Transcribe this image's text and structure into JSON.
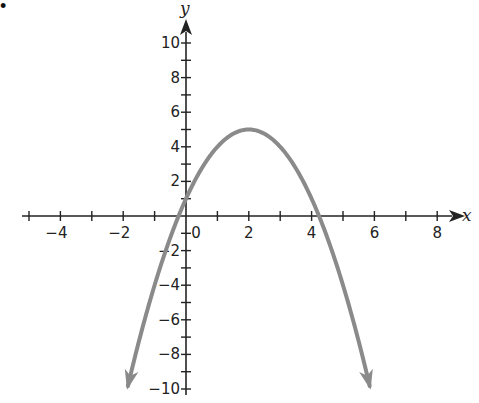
{
  "bullet": "•",
  "chart_data": {
    "type": "line",
    "title": "",
    "xlabel": "x",
    "ylabel": "y",
    "function": "y = -(x - 2)^2 + 5",
    "vertex": [
      2,
      5
    ],
    "y_intercept": 1,
    "x_intercepts": [
      -0.24,
      4.24
    ],
    "xlim": [
      -5.2,
      8.6
    ],
    "ylim": [
      -10.4,
      11.3
    ],
    "x_ticks": [
      -5,
      -4,
      -3,
      -2,
      -1,
      0,
      1,
      2,
      3,
      4,
      5,
      6,
      7,
      8
    ],
    "x_tick_labels": [
      "-4",
      "-2",
      "0",
      "2",
      "4",
      "6",
      "8"
    ],
    "x_tick_label_values": [
      -4,
      -2,
      0,
      2,
      4,
      6,
      8
    ],
    "y_ticks": [
      -10,
      -9,
      -8,
      -7,
      -6,
      -5,
      -4,
      -3,
      -2,
      -1,
      1,
      2,
      3,
      4,
      5,
      6,
      7,
      8,
      9,
      10
    ],
    "y_tick_labels": [
      "10",
      "8",
      "6",
      "4",
      "2",
      "-2",
      "-4",
      "-6",
      "-8",
      "-10"
    ],
    "y_tick_label_values": [
      10,
      8,
      6,
      4,
      2,
      -2,
      -4,
      -6,
      -8,
      -10
    ],
    "curve_domain": [
      -1.85,
      5.85
    ],
    "curve_arrows": "both ends",
    "grid": false,
    "legend": null,
    "colors": {
      "curve": "#8a8a8a",
      "axes": "#222222"
    }
  }
}
